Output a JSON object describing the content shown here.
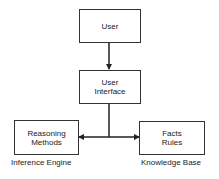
{
  "diagram": {
    "boxes": {
      "user": {
        "lines": [
          "User"
        ]
      },
      "user_interface": {
        "lines": [
          "User",
          "Interface"
        ]
      },
      "inference": {
        "lines": [
          "Reasoning",
          "Methods"
        ]
      },
      "knowledge": {
        "lines": [
          "Facts",
          "Rules"
        ]
      }
    },
    "captions": {
      "inference": "Inference Engine",
      "knowledge": "Knowledge Base"
    },
    "connections": [
      {
        "from": "user",
        "to": "user_interface",
        "type": "bidirectional"
      },
      {
        "from": "user_interface",
        "to": "junction",
        "type": "bidirectional"
      },
      {
        "from": "junction",
        "to": "inference",
        "type": "arrow"
      },
      {
        "from": "junction",
        "to": "knowledge",
        "type": "arrow"
      }
    ],
    "colors": {
      "stroke": "#333333",
      "background": "#ffffff",
      "text": "#222222"
    }
  }
}
